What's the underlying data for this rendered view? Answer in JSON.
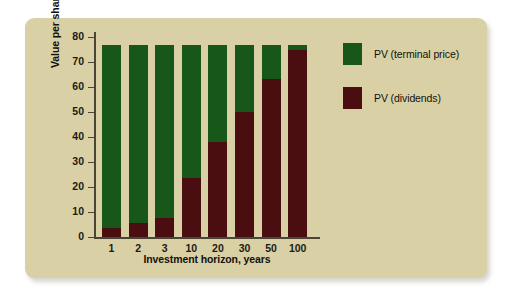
{
  "chart_data": {
    "type": "bar",
    "stacked": true,
    "title": "",
    "xlabel": "Investment horizon, years",
    "ylabel": "Value per share, dollars",
    "categories": [
      "1",
      "2",
      "3",
      "10",
      "20",
      "30",
      "50",
      "100"
    ],
    "series": [
      {
        "name": "PV (dividends)",
        "color": "#4a0d10",
        "values": [
          3.6,
          5.6,
          7.6,
          23.5,
          38,
          50,
          63,
          74.5
        ]
      },
      {
        "name": "PV (terminal price)",
        "color": "#18571a",
        "values": [
          72.9,
          70.9,
          68.9,
          53,
          38.5,
          26.5,
          13.5,
          2
        ]
      }
    ],
    "totals": [
      76.5,
      76.5,
      76.5,
      76.5,
      76.5,
      76.5,
      76.5,
      76.5
    ],
    "ylim": [
      0,
      80
    ],
    "yticks": [
      "0",
      "10",
      "20",
      "30",
      "40",
      "50",
      "60",
      "70",
      "80"
    ],
    "grid": false,
    "legend_position": "right",
    "legend": [
      {
        "label": "PV (terminal price)",
        "color": "#18571a"
      },
      {
        "label": "PV (dividends)",
        "color": "#4a0d10"
      }
    ]
  },
  "card": {
    "background_color": "#d9d0a6"
  }
}
